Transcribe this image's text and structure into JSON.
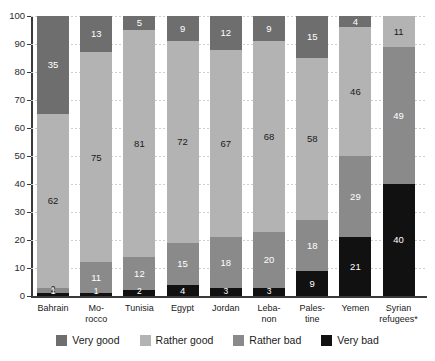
{
  "chart_data": {
    "type": "bar",
    "subtype": "stacked-bar-100-percent",
    "title": "",
    "xlabel": "",
    "ylabel": "",
    "ylim": [
      0,
      100
    ],
    "yticks": [
      0,
      10,
      20,
      30,
      40,
      50,
      60,
      70,
      80,
      90,
      100
    ],
    "grid": true,
    "legend_position": "bottom",
    "categories": [
      "Bahrain",
      "Mo-\nrocco",
      "Tunisia",
      "Egypt",
      "Jordan",
      "Leba-\nnon",
      "Pales-\ntine",
      "Yemen",
      "Syrian\nrefugees*"
    ],
    "series": [
      {
        "name": "Very good",
        "color": "#6e6e6e",
        "values": [
          35,
          13,
          5,
          9,
          12,
          9,
          15,
          4,
          0
        ]
      },
      {
        "name": "Rather good",
        "color": "#b3b3b3",
        "values": [
          62,
          75,
          81,
          72,
          67,
          68,
          58,
          46,
          11
        ]
      },
      {
        "name": "Rather bad",
        "color": "#8a8a8a",
        "values": [
          2,
          11,
          12,
          15,
          18,
          20,
          18,
          29,
          49
        ]
      },
      {
        "name": "Very bad",
        "color": "#111111",
        "values": [
          1,
          1,
          2,
          4,
          3,
          3,
          9,
          21,
          40
        ]
      }
    ]
  },
  "axis": {
    "y_tick_labels": [
      "100",
      "90",
      "80",
      "70",
      "60",
      "50",
      "40",
      "30",
      "20",
      "10",
      "0"
    ]
  },
  "categories_display": [
    {
      "line1": "Bahrain",
      "line2": ""
    },
    {
      "line1": "Mo-",
      "line2": "rocco"
    },
    {
      "line1": "Tunisia",
      "line2": ""
    },
    {
      "line1": "Egypt",
      "line2": ""
    },
    {
      "line1": "Jordan",
      "line2": ""
    },
    {
      "line1": "Leba-",
      "line2": "non"
    },
    {
      "line1": "Pales-",
      "line2": "tine"
    },
    {
      "line1": "Yemen",
      "line2": ""
    },
    {
      "line1": "Syrian",
      "line2": "refugees*"
    }
  ],
  "legend": {
    "items": [
      {
        "label": "Very good",
        "color": "#6e6e6e"
      },
      {
        "label": "Rather good",
        "color": "#b3b3b3"
      },
      {
        "label": "Rather bad",
        "color": "#8a8a8a"
      },
      {
        "label": "Very bad",
        "color": "#111111"
      }
    ]
  }
}
